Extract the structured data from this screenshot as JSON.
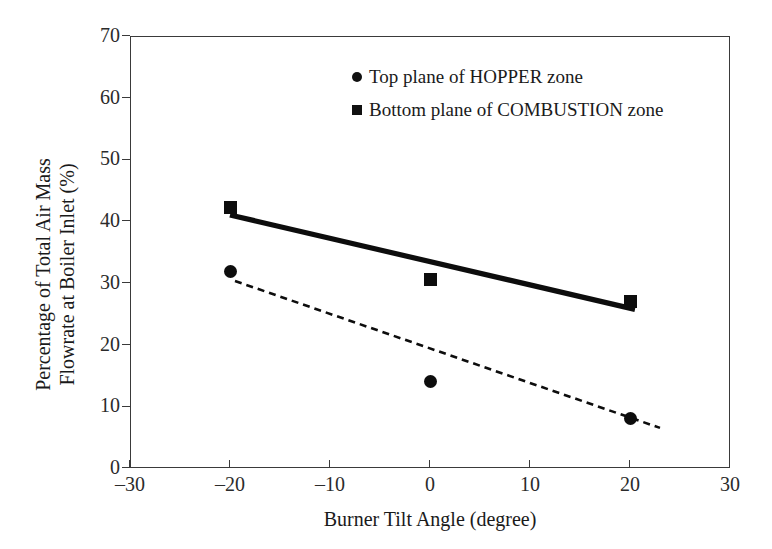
{
  "chart_data": {
    "type": "scatter",
    "title": "",
    "xlabel": "Burner Tilt Angle (degree)",
    "ylabel": "Percentage of Total Air Mass Flowrate at Boiler Inlet (%)",
    "ylabel_lines": [
      "Percentage of Total Air Mass",
      "Flowrate at Boiler Inlet (%)"
    ],
    "xlim": [
      -30,
      30
    ],
    "ylim": [
      0,
      70
    ],
    "xticks": [
      -30,
      -20,
      -10,
      0,
      10,
      20,
      30
    ],
    "xtick_labels": [
      "–30",
      "–20",
      "–10",
      "0",
      "10",
      "20",
      "30"
    ],
    "yticks": [
      0,
      10,
      20,
      30,
      40,
      50,
      60,
      70
    ],
    "ytick_labels": [
      "0",
      "10",
      "20",
      "30",
      "40",
      "50",
      "60",
      "70"
    ],
    "grid": false,
    "legend_position": "upper right inside",
    "series": [
      {
        "name": "Top plane of HOPPER zone",
        "marker": "circle",
        "color": "#0d0d0d",
        "x": [
          -20,
          0,
          20
        ],
        "values": [
          31.8,
          14.0,
          8.0
        ],
        "trendline": {
          "style": "dashed",
          "x": [
            -19.5,
            23.0
          ],
          "y": [
            30.3,
            6.5
          ]
        }
      },
      {
        "name": "Bottom plane of COMBUSTION zone",
        "marker": "square",
        "color": "#0d0d0d",
        "x": [
          -20,
          0,
          20
        ],
        "values": [
          42.2,
          30.5,
          27.0
        ],
        "trendline": {
          "style": "solid",
          "x": [
            -20.0,
            20.5
          ],
          "y": [
            41.0,
            25.7
          ]
        }
      }
    ]
  },
  "axes": {
    "x_title": "Burner Tilt Angle (degree)",
    "y_title_line1": "Percentage of Total Air Mass",
    "y_title_line2": "Flowrate at Boiler Inlet (%)",
    "x_tick_labels": [
      "–30",
      "–20",
      "–10",
      "0",
      "10",
      "20",
      "30"
    ],
    "y_tick_labels": [
      "0",
      "10",
      "20",
      "30",
      "40",
      "50",
      "60",
      "70"
    ]
  },
  "legend": {
    "items": [
      {
        "marker": "circle-marker",
        "label": "Top plane of HOPPER zone"
      },
      {
        "marker": "square-marker",
        "label": "Bottom plane of COMBUSTION zone"
      }
    ]
  },
  "colors": {
    "marker": "#0d0d0d",
    "axis": "#3a3a3a",
    "text": "#1a1a1a",
    "background": "#ffffff"
  }
}
